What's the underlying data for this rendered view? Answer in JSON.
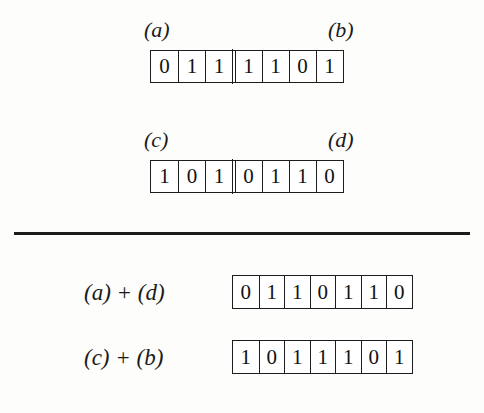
{
  "figure": {
    "background_color": "#fdfdfb",
    "ink_color": "#1a1a1a",
    "divider": {
      "label": "horizontal-rule"
    }
  },
  "parents": [
    {
      "id": "row-ab",
      "left_label": "(a)",
      "right_label": "(b)",
      "bits": [
        "0",
        "1",
        "1",
        "1",
        "1",
        "0",
        "1"
      ],
      "crossover_after": 3
    },
    {
      "id": "row-cd",
      "left_label": "(c)",
      "right_label": "(d)",
      "bits": [
        "1",
        "0",
        "1",
        "0",
        "1",
        "1",
        "0"
      ],
      "crossover_after": 3
    }
  ],
  "offspring": [
    {
      "id": "sum-ad",
      "label": "(a) + (d)",
      "bits": [
        "0",
        "1",
        "1",
        "0",
        "1",
        "1",
        "0"
      ],
      "crossover_after": 0
    },
    {
      "id": "sum-cb",
      "label": "(c) + (b)",
      "bits": [
        "1",
        "0",
        "1",
        "1",
        "1",
        "0",
        "1"
      ],
      "crossover_after": 0
    }
  ]
}
